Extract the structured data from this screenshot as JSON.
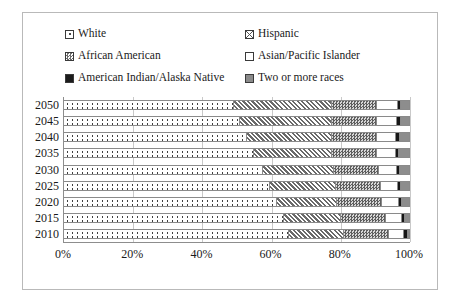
{
  "chart_data": {
    "type": "bar",
    "orientation": "horizontal",
    "stacked": true,
    "normalized": true,
    "title": "",
    "xlabel": "",
    "ylabel": "",
    "xlim": [
      0,
      100
    ],
    "xticks": [
      "0%",
      "20%",
      "40%",
      "60%",
      "80%",
      "100%"
    ],
    "xtick_values": [
      0,
      20,
      40,
      60,
      80,
      100
    ],
    "grid": "vertical",
    "legend_position": "top",
    "categories": [
      "2050",
      "2045",
      "2040",
      "2035",
      "2030",
      "2025",
      "2020",
      "2015",
      "2010"
    ],
    "series": [
      {
        "name": "White",
        "swatch": "white-dotted",
        "color": "#ffffff",
        "values": [
          49.0,
          51.0,
          53.0,
          55.0,
          57.5,
          59.5,
          61.5,
          63.5,
          65.0
        ]
      },
      {
        "name": "Hispanic",
        "swatch": "hispanic-diagonal",
        "color": "#6a6a6a",
        "values": [
          28.5,
          26.5,
          24.5,
          22.5,
          20.5,
          19.0,
          17.5,
          16.5,
          16.0
        ]
      },
      {
        "name": "African American",
        "swatch": "african-american-checker",
        "color": "#5e5e5e",
        "values": [
          13.0,
          13.0,
          13.0,
          13.0,
          13.0,
          13.0,
          13.0,
          13.0,
          13.0
        ]
      },
      {
        "name": "Asian/Pacific Islander",
        "swatch": "asian-pacific-blank",
        "color": "#ffffff",
        "values": [
          6.0,
          5.8,
          5.6,
          5.4,
          5.2,
          5.0,
          4.8,
          4.6,
          4.4
        ]
      },
      {
        "name": "American Indian/Alaska Native",
        "swatch": "american-indian-solid-black",
        "color": "#171717",
        "values": [
          1.0,
          1.0,
          1.0,
          1.0,
          1.0,
          1.0,
          1.0,
          1.0,
          1.0
        ]
      },
      {
        "name": "Two or more races",
        "swatch": "two-or-more-gray",
        "color": "#8d8d8d",
        "values": [
          2.5,
          2.7,
          2.9,
          3.1,
          2.8,
          2.5,
          2.2,
          1.4,
          0.6
        ]
      }
    ]
  },
  "legend": {
    "items": [
      {
        "label": "White",
        "swatch_class": "sw-white",
        "name": "white"
      },
      {
        "label": "Hispanic",
        "swatch_class": "sw-hisp",
        "name": "hispanic"
      },
      {
        "label": "African American",
        "swatch_class": "sw-afam",
        "name": "african-american"
      },
      {
        "label": "Asian/Pacific Islander",
        "swatch_class": "sw-asian",
        "name": "asian-pacific-islander"
      },
      {
        "label": "American Indian/Alaska Native",
        "swatch_class": "sw-amind",
        "name": "american-indian-alaska-native"
      },
      {
        "label": "Two or more races",
        "swatch_class": "sw-two",
        "name": "two-or-more-races"
      }
    ]
  }
}
